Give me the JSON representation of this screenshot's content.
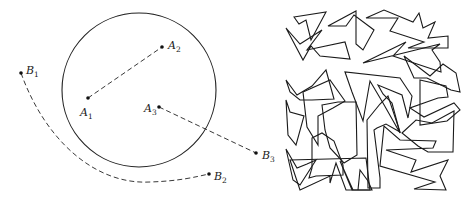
{
  "left_figure": {
    "circle": {
      "cx": 139,
      "cy": 90,
      "r": 77
    },
    "points": [
      {
        "id": "A1",
        "letter": "A",
        "sub": "1",
        "x": 88,
        "y": 98,
        "lx": 80,
        "ly": 116
      },
      {
        "id": "A2",
        "letter": "A",
        "sub": "2",
        "x": 162,
        "y": 47,
        "lx": 168,
        "ly": 49
      },
      {
        "id": "A3",
        "letter": "A",
        "sub": "3",
        "x": 159,
        "y": 107,
        "lx": 144,
        "ly": 112
      },
      {
        "id": "B1",
        "letter": "B",
        "sub": "1",
        "x": 21,
        "y": 73,
        "lx": 26,
        "ly": 74
      },
      {
        "id": "B2",
        "letter": "B",
        "sub": "2",
        "x": 209,
        "y": 174,
        "lx": 214,
        "ly": 180
      },
      {
        "id": "B3",
        "letter": "B",
        "sub": "3",
        "x": 256,
        "y": 153,
        "lx": 262,
        "ly": 159
      }
    ],
    "paths": [
      {
        "from": "A1",
        "to": "A2",
        "d": "M88,98 L162,47"
      },
      {
        "from": "A3",
        "to": "B3",
        "d": "M159,107 L256,153"
      },
      {
        "from": "B1",
        "to": "B2",
        "d": "M21,73 C45,140 95,185 150,182 C180,181 195,177 209,174"
      }
    ]
  },
  "right_figure": {
    "description": "square packed with interlocking jagged polygons",
    "polygons": [
      "M294,17 L326,12 L311,40 L306,20 L299,24 Z",
      "M286,28 L303,60 L311,46 L320,56 L350,59 L345,42 L307,50 L322,30 L300,44 Z",
      "M328,26 L356,11 L356,44 L363,50 L374,30 L354,15 L346,26 Z",
      "M366,18 L384,10 L413,22 L419,13 L423,28 L435,22 L428,38 L448,36 L448,48 L408,48 L424,42 L390,31 L398,18 Z",
      "M363,63 L406,42 L393,56 L441,72 L440,62 L432,50 L440,44 Z",
      "M404,56 L430,76 L443,64 L456,73 L460,92 L451,90 L427,78 L414,78 Z",
      "M286,80 L297,95 L312,86 L326,70 L334,99 L312,100 L300,100 L290,92 Z",
      "M286,100 L288,135 L296,145 L304,116 L290,112 Z",
      "M303,92 L330,80 L345,101 L333,108 L318,116 L318,145 L307,127 Z",
      "M345,72 L352,92 L363,121 L370,81 L383,103 L400,133 L392,103 L383,94 L378,85 L402,95 L408,118 L412,96 L400,78 Z",
      "M420,80 L446,86 L448,97 L438,98 L410,108 L424,117 L454,103 L460,110 L447,121 L420,125 Z",
      "M402,133 L416,120 L432,123 L454,111 L453,152 L428,152 L418,146 Z",
      "M322,105 L338,102 L356,102 L357,155 L344,163 L330,148 L325,130 Z",
      "M286,149 L293,180 L300,185 L316,160 L307,164 L297,168 Z",
      "M312,138 L322,133 L334,141 L343,165 L343,175 L316,176 L309,178 L312,168 Z",
      "M367,120 L380,104 L388,96 L400,132 L386,124 L377,128 L374,130 L380,178 L380,188 L368,188 Z",
      "M340,161 L353,190 L358,190 L360,170 L368,181 L372,190 L352,190 Z",
      "M384,126 L380,166 L435,182 L414,189 L446,190 L440,176 L448,160 L411,172 L416,160 L386,150 L433,148 L436,141 L400,140 Z",
      "M290,160 L300,190 L330,176 L330,183 L336,163 L346,190 L370,190 L366,158 Z"
    ]
  }
}
